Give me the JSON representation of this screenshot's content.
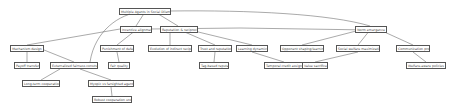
{
  "diagram": {
    "root": "Multiple Agents in Social Dilemmas",
    "nodes": [
      {
        "id": "root",
        "label": "Multiple Agents in Social Dilemmas",
        "x": 119,
        "y": 8,
        "w": 52
      },
      {
        "id": "n1",
        "label": "Incentive alignment",
        "x": 120,
        "y": 26,
        "w": 32
      },
      {
        "id": "n2",
        "label": "Reputation & reciprocity",
        "x": 160,
        "y": 26,
        "w": 38
      },
      {
        "id": "n3",
        "label": "Norm emergence",
        "x": 355,
        "y": 26,
        "w": 32
      },
      {
        "id": "n4",
        "label": "Mechanism design",
        "x": 10,
        "y": 45,
        "w": 34
      },
      {
        "id": "n5",
        "label": "Punishment of defectors",
        "x": 100,
        "y": 45,
        "w": 34
      },
      {
        "id": "n6",
        "label": "Evolution of indirect reciprocity",
        "x": 148,
        "y": 45,
        "w": 44
      },
      {
        "id": "n7",
        "label": "Trust and reputation",
        "x": 198,
        "y": 45,
        "w": 34
      },
      {
        "id": "n8",
        "label": "Learning dynamics",
        "x": 236,
        "y": 45,
        "w": 32
      },
      {
        "id": "n9",
        "label": "Opponent shaping/learning-aware",
        "x": 280,
        "y": 45,
        "w": 44
      },
      {
        "id": "n10",
        "label": "Social welfare maximization",
        "x": 336,
        "y": 45,
        "w": 44
      },
      {
        "id": "n11",
        "label": "Communication protocols",
        "x": 396,
        "y": 45,
        "w": 34
      },
      {
        "id": "n12",
        "label": "Payoff transfers",
        "x": 14,
        "y": 62,
        "w": 26
      },
      {
        "id": "n13",
        "label": "Externalized fairness constraints",
        "x": 50,
        "y": 62,
        "w": 48
      },
      {
        "id": "n14",
        "label": "Fair quality",
        "x": 108,
        "y": 62,
        "w": 22
      },
      {
        "id": "n15",
        "label": "Tag-based reputation",
        "x": 199,
        "y": 62,
        "w": 30
      },
      {
        "id": "n16",
        "label": "Temporal credit assignment",
        "x": 264,
        "y": 62,
        "w": 40
      },
      {
        "id": "n17",
        "label": "Value sacrifice",
        "x": 302,
        "y": 62,
        "w": 26
      },
      {
        "id": "n18",
        "label": "Welfare-aware policies",
        "x": 406,
        "y": 62,
        "w": 40
      },
      {
        "id": "n19",
        "label": "Long-term cooperation",
        "x": 22,
        "y": 80,
        "w": 38
      },
      {
        "id": "n20",
        "label": "Myopic vs farsighted agents",
        "x": 88,
        "y": 80,
        "w": 46
      },
      {
        "id": "n21",
        "label": "Robust cooperation under noise",
        "x": 92,
        "y": 96,
        "w": 40
      }
    ]
  }
}
